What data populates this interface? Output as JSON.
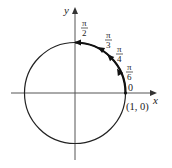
{
  "diagram": {
    "type": "unit-circle",
    "axes": {
      "x_label": "x",
      "y_label": "y"
    },
    "point_label": "(1, 0)",
    "angle_labels": [
      {
        "id": "zero",
        "text": "0"
      },
      {
        "id": "pi6",
        "num": "π",
        "den": "6"
      },
      {
        "id": "pi4",
        "num": "π",
        "den": "4"
      },
      {
        "id": "pi3",
        "num": "π",
        "den": "3"
      },
      {
        "id": "pi2",
        "num": "π",
        "den": "2"
      }
    ],
    "colors": {
      "stroke": "#222222",
      "axis": "#555555",
      "background": "#ffffff"
    }
  }
}
